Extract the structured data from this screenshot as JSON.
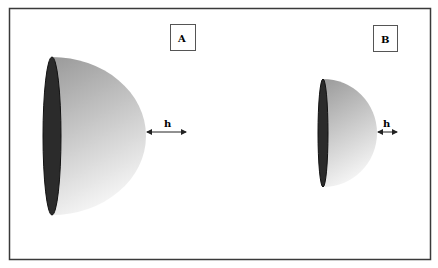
{
  "figure": {
    "panels": [
      {
        "id": "A",
        "label": "A",
        "dimension_label": "h"
      },
      {
        "id": "B",
        "label": "B",
        "dimension_label": "h"
      }
    ]
  },
  "colors": {
    "frame": "#3a3a3a",
    "base_ellipse": "#2b2b2b",
    "dome_dark": "#9a9a9a",
    "dome_light": "#f2f2f2"
  }
}
